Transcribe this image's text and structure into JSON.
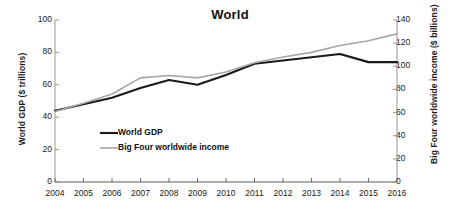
{
  "chart_data": {
    "type": "line",
    "title": "World",
    "xlabel": "",
    "x": [
      2004,
      2005,
      2006,
      2007,
      2008,
      2009,
      2010,
      2011,
      2012,
      2013,
      2014,
      2015,
      2016
    ],
    "categories": [
      "2004",
      "2005",
      "2006",
      "2007",
      "2008",
      "2009",
      "2010",
      "2011",
      "2012",
      "2013",
      "2014",
      "2015",
      "2016"
    ],
    "grid": false,
    "legend_position": "inside-lower-left",
    "axes": {
      "left": {
        "label": "World GDP ($ trillions)",
        "ticks": [
          0,
          20,
          40,
          60,
          80,
          100
        ],
        "tick_labels": [
          "0",
          "20",
          "40",
          "60",
          "80",
          "100"
        ],
        "ylim": [
          0,
          100
        ]
      },
      "right": {
        "label": "Big Four worldwide income ($ billions)",
        "ticks": [
          0,
          20,
          40,
          60,
          80,
          100,
          120,
          140
        ],
        "tick_labels": [
          "0",
          "20",
          "40",
          "60",
          "80",
          "100",
          "120",
          "140"
        ],
        "ylim": [
          0,
          140
        ]
      }
    },
    "series": [
      {
        "name": "World GDP",
        "axis": "left",
        "unit": "$ trillions",
        "color": "#1a1a1a",
        "width": 2.1,
        "values": [
          44,
          48,
          52,
          58,
          63,
          60,
          66,
          73,
          75,
          77,
          79,
          74,
          74
        ]
      },
      {
        "name": "Big Four worldwide income",
        "axis": "right",
        "unit": "$ billions",
        "color": "#a6a6a6",
        "width": 1.6,
        "values": [
          61,
          68,
          76,
          90,
          92,
          90,
          95,
          103,
          108,
          112,
          118,
          122,
          128
        ]
      }
    ]
  },
  "legend": {
    "items": [
      {
        "label": "World GDP",
        "color": "#1a1a1a",
        "width": 2.1
      },
      {
        "label": "Big Four worldwide income",
        "color": "#a6a6a6",
        "width": 1.6
      }
    ]
  }
}
